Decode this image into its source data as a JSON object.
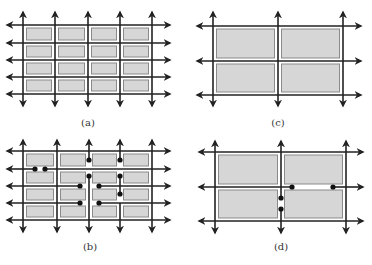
{
  "panels": [
    {
      "id": "a",
      "label": "(a)",
      "label_pos": [
        88,
        126
      ],
      "description": "4x4 grid of gray rectangles with 5 full vertical and 5 full horizontal bidirectional arrows",
      "vlines": [
        23,
        55,
        88,
        120,
        152
      ],
      "hlines": [
        25,
        43,
        60,
        77,
        94
      ],
      "v_extent": [
        12,
        106
      ],
      "h_extent": [
        7,
        170
      ],
      "segments_v": [],
      "segments_h": [],
      "dots": [],
      "rects": "grid"
    },
    {
      "id": "c",
      "label": "(c)",
      "label_pos": [
        278,
        126
      ],
      "description": "2x2 grid of gray rectangles with 3 vertical and 3 horizontal bidirectional arrows",
      "vlines": [
        213,
        278,
        343
      ],
      "hlines": [
        26,
        61,
        95
      ],
      "v_extent": [
        12,
        106
      ],
      "h_extent": [
        197,
        361
      ],
      "rects": "grid"
    },
    {
      "id": "b",
      "label": "(b)",
      "label_pos": [
        90,
        250
      ],
      "description": "4x4 grid with some arrow lines broken; black dots mark the broken endpoints",
      "vlines": [
        23,
        57,
        89,
        120,
        152
      ],
      "hlines": [
        151,
        169,
        186,
        203,
        220
      ],
      "v_extent": [
        140,
        232
      ],
      "h_extent": [
        7,
        170
      ],
      "dots": [
        [
          35,
          169
        ],
        [
          45,
          169
        ],
        [
          89,
          160
        ],
        [
          89,
          176
        ],
        [
          120,
          160
        ],
        [
          120,
          176
        ],
        [
          120,
          194
        ],
        [
          80,
          186
        ],
        [
          99,
          186
        ],
        [
          80,
          203
        ],
        [
          99,
          203
        ]
      ]
    },
    {
      "id": "d",
      "label": "(d)",
      "label_pos": [
        281,
        250
      ],
      "description": "2x2 grid with middle horizontal and middle vertical arrows broken; black dots at the break endpoints",
      "vlines": [
        215,
        281,
        346
      ],
      "hlines": [
        152,
        187,
        221
      ],
      "v_extent": [
        141,
        233
      ],
      "h_extent": [
        199,
        363
      ],
      "dots": [
        [
          292,
          187
        ],
        [
          333,
          187
        ],
        [
          281,
          198
        ],
        [
          281,
          209
        ]
      ]
    }
  ],
  "colors": {
    "line": "#222222",
    "rect_fill": "#d6d6d6",
    "rect_stroke": "#8a8a8a",
    "dot": "#111111"
  }
}
